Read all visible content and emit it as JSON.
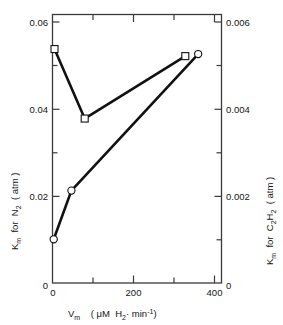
{
  "chart_data": {
    "type": "line",
    "title": "",
    "xlabel": "V_m ( μM H₂· min⁻¹ )",
    "ylabel": "K_m for N₂ ( atm )",
    "y2label": "K_m for C₂H₂ ( atm )",
    "xlim": [
      0,
      420
    ],
    "ylim": [
      0,
      0.0645
    ],
    "y2lim": [
      0,
      0.00645
    ],
    "grid": false,
    "legend": "none",
    "xticks": [
      0,
      200,
      400
    ],
    "xticklabels": [
      "0",
      "200",
      "400"
    ],
    "xminorticks": [
      100,
      300
    ],
    "yticks": [
      0,
      0.02,
      0.04,
      0.06
    ],
    "yticklabels": [
      "0",
      "0.02",
      "0.04",
      "0.06"
    ],
    "yminorticks": [
      0.01,
      0.03,
      0.05
    ],
    "y2ticks": [
      0,
      0.002,
      0.004,
      0.006
    ],
    "y2ticklabels": [
      "0",
      "0.002",
      "0.004",
      "0.006"
    ],
    "y2minorticks": [
      0.001,
      0.003,
      0.005
    ],
    "series": [
      {
        "name": "K_m for N₂",
        "marker": "open-square",
        "axis": "left",
        "x": [
          5,
          80,
          330
        ],
        "values": [
          0.0562,
          0.0395,
          0.0545
        ]
      },
      {
        "name": "K_m for C₂H₂",
        "marker": "open-circle",
        "axis": "right",
        "x": [
          3,
          47,
          362
        ],
        "values": [
          0.00105,
          0.00222,
          0.0055
        ]
      }
    ]
  },
  "axes": {
    "left": {
      "parts": [
        "K",
        "m",
        "for",
        "N",
        "2",
        "( atm )"
      ],
      "km_main": "K",
      "km_sub": "m",
      "for": "for",
      "n_main": "N",
      "n_sub": "2",
      "units": "( atm )"
    },
    "right": {
      "km_main": "K",
      "km_sub": "m",
      "for": "for",
      "c_main": "C",
      "c_sub1": "2",
      "h_main": "H",
      "h_sub2": "2",
      "units": "( atm )"
    },
    "bottom": {
      "v_main": "V",
      "v_sub": "m",
      "open_paren": "(",
      "micromolar": "μM",
      "h_main": "H",
      "h_sub": "2",
      "dot": "·",
      "min": "min",
      "min_sup": "-1",
      "close_paren": ")"
    }
  },
  "tick_text": {
    "y_left": [
      "0.06",
      "0.04",
      "0.02",
      "0"
    ],
    "y_right": [
      "0.006",
      "0.004",
      "0.002",
      "0"
    ],
    "x": [
      "0",
      "200",
      "400"
    ]
  },
  "style": {
    "line_color": "#111111",
    "axis_color": "#3a3a3a",
    "marker_fill": "#ffffff",
    "background": "#ffffff"
  }
}
